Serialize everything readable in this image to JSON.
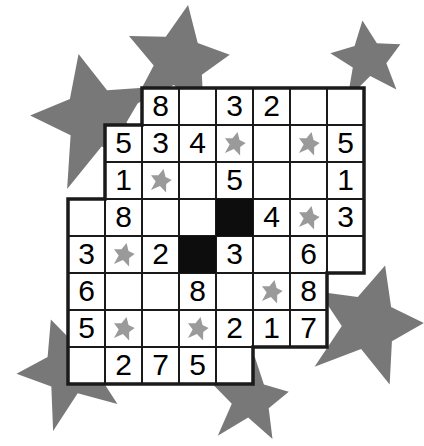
{
  "puzzle": {
    "title": "Star Sudoku Irregular Grid",
    "type": "sudoku-variant",
    "colors": {
      "background": "#ffffff",
      "grid_line": "#1a1a1a",
      "cell_fill": "#ffffff",
      "blocked_cell": "#0d0d0d",
      "digit": "#000000",
      "cell_star": "#9a9a9a",
      "decor_star": "#787878"
    },
    "geometry": {
      "cell_size": 37,
      "origin_x": 68,
      "origin_y": 88,
      "columns": 8,
      "rows": 8
    },
    "rows": [
      {
        "index": 1,
        "start_col": 3,
        "cells": [
          {
            "col": 3,
            "kind": "digit",
            "value": "8"
          },
          {
            "col": 4,
            "kind": "empty",
            "value": ""
          },
          {
            "col": 5,
            "kind": "digit",
            "value": "3"
          },
          {
            "col": 6,
            "kind": "digit",
            "value": "2"
          },
          {
            "col": 7,
            "kind": "empty",
            "value": ""
          },
          {
            "col": 8,
            "kind": "empty",
            "value": ""
          }
        ]
      },
      {
        "index": 2,
        "start_col": 2,
        "cells": [
          {
            "col": 2,
            "kind": "digit",
            "value": "5"
          },
          {
            "col": 3,
            "kind": "digit",
            "value": "3"
          },
          {
            "col": 4,
            "kind": "digit",
            "value": "4"
          },
          {
            "col": 5,
            "kind": "star",
            "value": ""
          },
          {
            "col": 6,
            "kind": "empty",
            "value": ""
          },
          {
            "col": 7,
            "kind": "star",
            "value": ""
          },
          {
            "col": 8,
            "kind": "digit",
            "value": "5"
          }
        ]
      },
      {
        "index": 3,
        "start_col": 2,
        "cells": [
          {
            "col": 2,
            "kind": "digit",
            "value": "1"
          },
          {
            "col": 3,
            "kind": "star",
            "value": ""
          },
          {
            "col": 4,
            "kind": "empty",
            "value": ""
          },
          {
            "col": 5,
            "kind": "digit",
            "value": "5"
          },
          {
            "col": 6,
            "kind": "empty",
            "value": ""
          },
          {
            "col": 7,
            "kind": "empty",
            "value": ""
          },
          {
            "col": 8,
            "kind": "digit",
            "value": "1"
          }
        ]
      },
      {
        "index": 4,
        "start_col": 1,
        "cells": [
          {
            "col": 1,
            "kind": "empty",
            "value": ""
          },
          {
            "col": 2,
            "kind": "digit",
            "value": "8"
          },
          {
            "col": 3,
            "kind": "empty",
            "value": ""
          },
          {
            "col": 4,
            "kind": "empty",
            "value": ""
          },
          {
            "col": 5,
            "kind": "blocked",
            "value": ""
          },
          {
            "col": 6,
            "kind": "digit",
            "value": "4"
          },
          {
            "col": 7,
            "kind": "star",
            "value": ""
          },
          {
            "col": 8,
            "kind": "digit",
            "value": "3"
          }
        ]
      },
      {
        "index": 5,
        "start_col": 1,
        "cells": [
          {
            "col": 1,
            "kind": "digit",
            "value": "3"
          },
          {
            "col": 2,
            "kind": "star",
            "value": ""
          },
          {
            "col": 3,
            "kind": "digit",
            "value": "2"
          },
          {
            "col": 4,
            "kind": "blocked",
            "value": ""
          },
          {
            "col": 5,
            "kind": "digit",
            "value": "3"
          },
          {
            "col": 6,
            "kind": "empty",
            "value": ""
          },
          {
            "col": 7,
            "kind": "digit",
            "value": "6"
          },
          {
            "col": 8,
            "kind": "empty",
            "value": ""
          }
        ]
      },
      {
        "index": 6,
        "start_col": 1,
        "cells": [
          {
            "col": 1,
            "kind": "digit",
            "value": "6"
          },
          {
            "col": 2,
            "kind": "empty",
            "value": ""
          },
          {
            "col": 3,
            "kind": "empty",
            "value": ""
          },
          {
            "col": 4,
            "kind": "digit",
            "value": "8"
          },
          {
            "col": 5,
            "kind": "empty",
            "value": ""
          },
          {
            "col": 6,
            "kind": "star",
            "value": ""
          },
          {
            "col": 7,
            "kind": "digit",
            "value": "8"
          }
        ]
      },
      {
        "index": 7,
        "start_col": 1,
        "cells": [
          {
            "col": 1,
            "kind": "digit",
            "value": "5"
          },
          {
            "col": 2,
            "kind": "star",
            "value": ""
          },
          {
            "col": 3,
            "kind": "empty",
            "value": ""
          },
          {
            "col": 4,
            "kind": "star",
            "value": ""
          },
          {
            "col": 5,
            "kind": "digit",
            "value": "2"
          },
          {
            "col": 6,
            "kind": "digit",
            "value": "1"
          },
          {
            "col": 7,
            "kind": "digit",
            "value": "7"
          }
        ]
      },
      {
        "index": 8,
        "start_col": 1,
        "cells": [
          {
            "col": 1,
            "kind": "empty",
            "value": ""
          },
          {
            "col": 2,
            "kind": "digit",
            "value": "2"
          },
          {
            "col": 3,
            "kind": "digit",
            "value": "7"
          },
          {
            "col": 4,
            "kind": "digit",
            "value": "5"
          },
          {
            "col": 5,
            "kind": "empty",
            "value": ""
          }
        ]
      }
    ],
    "decor_stars": [
      {
        "name": "decor-star-top-left",
        "cx": 95,
        "cy": 120,
        "r": 68,
        "rot": -14
      },
      {
        "name": "decor-star-top-center",
        "cx": 178,
        "cy": 62,
        "r": 58,
        "rot": 10
      },
      {
        "name": "decor-star-top-right",
        "cx": 368,
        "cy": 60,
        "r": 40,
        "rot": -8
      },
      {
        "name": "decor-star-right",
        "cx": 368,
        "cy": 325,
        "r": 62,
        "rot": 16
      },
      {
        "name": "decor-star-bottom-left",
        "cx": 70,
        "cy": 372,
        "r": 56,
        "rot": -20
      },
      {
        "name": "decor-star-bottom-center",
        "cx": 250,
        "cy": 400,
        "r": 44,
        "rot": 6
      }
    ]
  }
}
